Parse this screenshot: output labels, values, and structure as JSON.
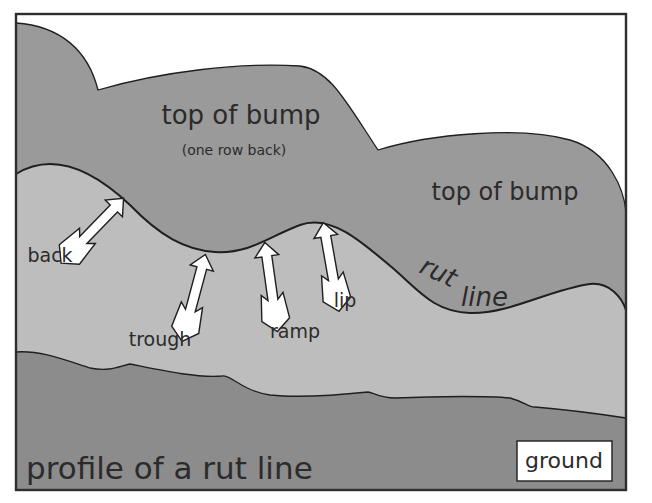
{
  "diagram": {
    "title": "profile of a rut line",
    "colors": {
      "background": "#ffffff",
      "frame": "#2e2e2e",
      "far_bump": "#9a9a9a",
      "near_slope": "#bdbdbd",
      "ground": "#8c8c8c",
      "arrow_fill": "#ffffff",
      "outline": "#1f1f1f",
      "text": "#2b2b2b"
    },
    "regions": {
      "far_bump_label": "top of bump",
      "far_bump_sublabel": "(one row back)",
      "near_bump_label": "top of bump",
      "ground_label": "ground"
    },
    "curve_label": {
      "rut": "rut",
      "line": "line"
    },
    "arrows": [
      {
        "id": "back",
        "label": "back"
      },
      {
        "id": "trough",
        "label": "trough"
      },
      {
        "id": "ramp",
        "label": "ramp"
      },
      {
        "id": "lip",
        "label": "lip"
      }
    ]
  }
}
